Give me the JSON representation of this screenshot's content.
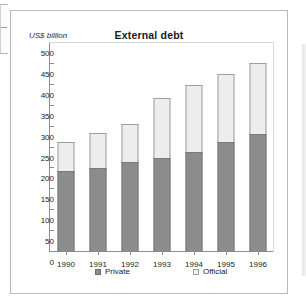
{
  "figure": {
    "unit_label": "US$  billion"
  },
  "legend": {
    "private_label": "Private",
    "official_label": "Official"
  },
  "colors": {
    "private": "#8c8c8c",
    "official": "#ededed",
    "axis": "#8c8c8c",
    "frame": "#b9b9b9"
  },
  "chart_data": {
    "type": "bar",
    "stacked": true,
    "title": "External debt",
    "xlabel": "",
    "ylabel": "US$ billion",
    "ylim": [
      0,
      500
    ],
    "yticks": [
      0,
      50,
      100,
      150,
      200,
      250,
      300,
      350,
      400,
      450,
      500
    ],
    "ytick_labels": [
      "0",
      "50",
      "100",
      "150",
      "200",
      "250",
      "300",
      "350",
      "400",
      "450",
      "500"
    ],
    "grid": false,
    "legend_position": "bottom",
    "categories": [
      "1990",
      "1991",
      "1992",
      "1993",
      "1994",
      "1995",
      "1996"
    ],
    "series": [
      {
        "name": "Private",
        "values": [
          192,
          198,
          212,
          223,
          236,
          261,
          279
        ]
      },
      {
        "name": "Official",
        "values": [
          69,
          85,
          91,
          143,
          160,
          163,
          170
        ]
      }
    ],
    "totals": [
      261,
      283,
      303,
      366,
      396,
      424,
      449
    ]
  }
}
